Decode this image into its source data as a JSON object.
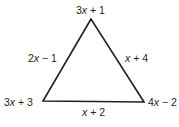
{
  "diagram": {
    "type": "triangle",
    "vertices": {
      "top": {
        "label": "3x + 1",
        "coef": "3",
        "var": "x",
        "rest": " + 1"
      },
      "bottom_left": {
        "label": "3x + 3",
        "coef": "3",
        "var": "x",
        "rest": " + 3"
      },
      "bottom_right": {
        "label": "4x − 2",
        "coef": "4",
        "var": "x",
        "rest": " − 2"
      }
    },
    "sides": {
      "left": {
        "label": "2x − 1",
        "coef": "2",
        "var": "x",
        "rest": " − 1"
      },
      "right": {
        "label": "x + 4",
        "coef": "",
        "var": "x",
        "rest": " + 4"
      },
      "bottom": {
        "label": "x + 2",
        "coef": "",
        "var": "x",
        "rest": " + 2"
      }
    },
    "colors": {
      "stroke": "#231f20",
      "text": "#231f20",
      "background": "#ffffff"
    }
  }
}
